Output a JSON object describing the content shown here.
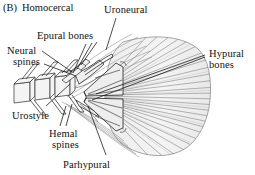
{
  "figure": {
    "panel_letter": "(B)",
    "panel_title": "Homocercal",
    "type": "anatomical-line-diagram",
    "background_color": "#ffffff",
    "line_color": "#333333",
    "fill_color": "#f2f2f2"
  },
  "labels": {
    "uroneural": "Uroneural",
    "epural_bones": "Epural bones",
    "neural_spines_line1": "Neural",
    "neural_spines_line2": "spines",
    "hypural_bones_line1": "Hypural",
    "hypural_bones_line2": "bones",
    "urostyle": "Urostyle",
    "hemal_spines_line1": "Hemal",
    "hemal_spines_line2": "spines",
    "parhypural": "Parhypural"
  },
  "structures": [
    {
      "name": "vertebral-column",
      "description": "Boxy centra at left forming the posterior vertebrae"
    },
    {
      "name": "urostyle",
      "description": "Upturned terminal rod of the vertebral column"
    },
    {
      "name": "uroneural",
      "description": "Thin bone lying along the dorsal side of the urostyle"
    },
    {
      "name": "epural-bones",
      "description": "Small dorsal bones anterior to the hypurals"
    },
    {
      "name": "neural-spines",
      "description": "Dorsal projections from the vertebral centra"
    },
    {
      "name": "hemal-spines",
      "description": "Ventral projections from the vertebral centra"
    },
    {
      "name": "parhypural",
      "description": "Ventral-most hypural-like element"
    },
    {
      "name": "hypural-bones",
      "description": "Fan of plate bones supporting the caudal fin rays"
    },
    {
      "name": "caudal-fin-rays",
      "description": "Radiating fin rays forming the symmetrical tail blade"
    }
  ]
}
